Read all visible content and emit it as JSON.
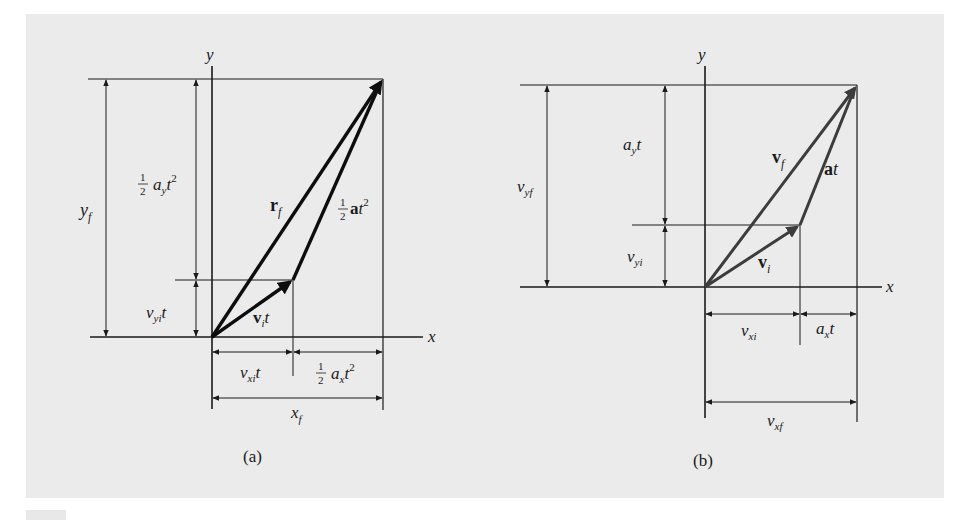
{
  "figure": {
    "panels": [
      {
        "id": "a",
        "caption": "(a)",
        "axes": {
          "x": "x",
          "y": "y"
        },
        "vectors": [
          {
            "name": "position-final",
            "label": "r",
            "sub": "f",
            "bold": true
          },
          {
            "name": "initial-displacement",
            "label": "v",
            "sub": "i",
            "suffix": "t",
            "bold": true
          },
          {
            "name": "acceleration-displacement",
            "prefix_fraction": "1/2",
            "label": "a",
            "suffix": "t",
            "sup": "2",
            "bold": true
          }
        ],
        "dimensions": {
          "y_f": {
            "main": "y",
            "sub": "f"
          },
          "half_ay_t2": {
            "frac_num": "1",
            "frac_den": "2",
            "main": "a",
            "sub": "y",
            "tail": "t",
            "sup": "2"
          },
          "vyi_t": {
            "main": "v",
            "sub": "yi",
            "tail": "t"
          },
          "vxi_t": {
            "main": "v",
            "sub": "xi",
            "tail": "t"
          },
          "half_ax_t2": {
            "frac_num": "1",
            "frac_den": "2",
            "main": "a",
            "sub": "x",
            "tail": "t",
            "sup": "2"
          },
          "x_f": {
            "main": "x",
            "sub": "f"
          }
        },
        "vector_color": "#0d0d0d"
      },
      {
        "id": "b",
        "caption": "(b)",
        "axes": {
          "x": "x",
          "y": "y"
        },
        "vectors": [
          {
            "name": "velocity-final",
            "label": "v",
            "sub": "f",
            "bold": true
          },
          {
            "name": "velocity-initial",
            "label": "v",
            "sub": "i",
            "bold": true
          },
          {
            "name": "acceleration-times-t",
            "label": "a",
            "suffix": "t",
            "bold": true
          }
        ],
        "dimensions": {
          "v_yf": {
            "main": "v",
            "sub": "yf"
          },
          "ay_t": {
            "main": "a",
            "sub": "y",
            "tail": "t"
          },
          "v_yi": {
            "main": "v",
            "sub": "yi"
          },
          "v_xi": {
            "main": "v",
            "sub": "xi"
          },
          "ax_t": {
            "main": "a",
            "sub": "x",
            "tail": "t"
          },
          "v_xf": {
            "main": "v",
            "sub": "xf"
          }
        },
        "vector_color": "#3c3c3c"
      }
    ],
    "colors": {
      "background": "#ffffff",
      "panel": "#ebebeb",
      "line": "#1a1a1a"
    }
  }
}
